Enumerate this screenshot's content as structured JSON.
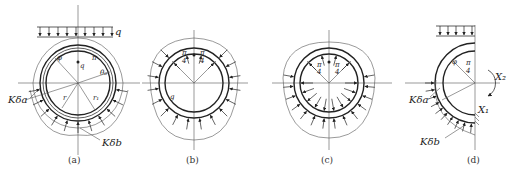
{
  "figure": {
    "panels": [
      {
        "id": "a",
        "caption": "(a)",
        "labels": {
          "load": "q",
          "theta": "φ",
          "pi_over_4": "π/4",
          "theta0": "θ₀",
          "r": "r",
          "r1": "r₁",
          "k_delta_a": "Kδa",
          "k_delta_b": "Kδb",
          "pi_num": "π",
          "pi_den": "4"
        }
      },
      {
        "id": "b",
        "caption": "(b)",
        "labels": {
          "g": "g",
          "pi_num": "π",
          "pi_den": "4"
        }
      },
      {
        "id": "c",
        "caption": "(c)",
        "labels": {
          "pi_num": "π",
          "pi_den": "4"
        }
      },
      {
        "id": "d",
        "caption": "(d)",
        "labels": {
          "theta": "φ",
          "pi_num": "π",
          "pi_den": "4",
          "x1": "X₁",
          "x2": "X₂",
          "k_delta_a": "Kδa",
          "k_delta_b": "Kδb"
        }
      }
    ]
  }
}
